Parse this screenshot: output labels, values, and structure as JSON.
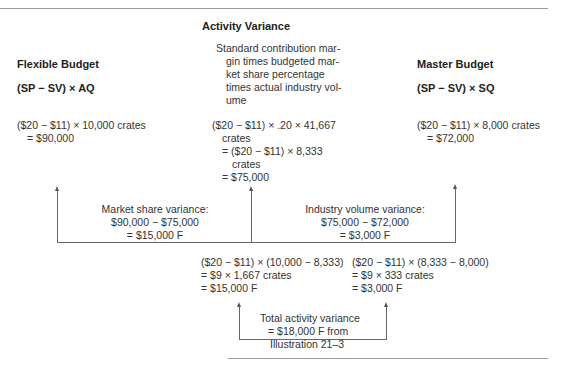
{
  "header": {
    "activity_title": "Activity Variance"
  },
  "columns": {
    "flexible": {
      "title": "Flexible Budget",
      "formula": "(SP − SV) × AQ",
      "calc": [
        "($20 − $11) × 10,000 crates",
        "= $90,000"
      ]
    },
    "activity": {
      "description": [
        "Standard contribution mar-",
        "gin times budgeted mar-",
        "ket share percentage",
        "times actual industry vol-",
        "ume"
      ],
      "calc": [
        "($20 − $11) × .20 × 41,667",
        "crates",
        "= ($20 − $11) × 8,333",
        "crates",
        "= $75,000"
      ]
    },
    "master": {
      "title": "Master Budget",
      "formula": "(SP − SV) × SQ",
      "calc": [
        "($20 − $11) × 8,000 crates",
        "= $72,000"
      ]
    }
  },
  "variances": {
    "market_share": {
      "label": [
        "Market share variance:",
        "$90,000 − $75,000",
        "= $15,000 F"
      ],
      "detail": [
        "($20 − $11) × (10,000 − 8,333)",
        "= $9 × 1,667 crates",
        "= $15,000 F"
      ]
    },
    "industry_volume": {
      "label": [
        "Industry volume variance:",
        "$75,000 − $72,000",
        "= $3,000 F"
      ],
      "detail": [
        "($20 − $11) × (8,333 − 8,000)",
        "= $9 × 333 crates",
        "= $3,000 F"
      ]
    },
    "total": {
      "label": [
        "Total activity variance",
        "= $18,000 F from",
        "Illustration 21–3"
      ]
    }
  }
}
